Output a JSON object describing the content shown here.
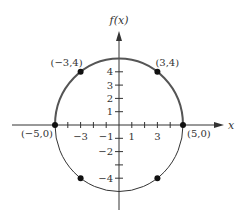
{
  "chart_data": {
    "type": "scatter",
    "title": "",
    "xlabel": "x",
    "ylabel": "f(x)",
    "xlim": [
      -5,
      5
    ],
    "ylim": [
      -5,
      5
    ],
    "grid": false,
    "curves": [
      {
        "name": "upper-semicircle",
        "equation": "y = sqrt(25 - x^2)",
        "emphasis": "bold"
      },
      {
        "name": "lower-semicircle",
        "equation": "y = -sqrt(25 - x^2)",
        "emphasis": "thin"
      }
    ],
    "points": [
      {
        "x": -3,
        "y": 4,
        "label": "(−3,4)"
      },
      {
        "x": 3,
        "y": 4,
        "label": "(3,4)"
      },
      {
        "x": -5,
        "y": 0,
        "label": "(−5,0)"
      },
      {
        "x": 5,
        "y": 0,
        "label": "(5,0)"
      },
      {
        "x": -3,
        "y": -4,
        "label": ""
      },
      {
        "x": 3,
        "y": -4,
        "label": ""
      }
    ],
    "x_ticks": [
      -4,
      -3,
      -2,
      -1,
      1,
      2,
      3,
      4
    ],
    "x_tick_labels": [
      {
        "value": -3,
        "text": "−3"
      },
      {
        "value": -1,
        "text": "−1"
      },
      {
        "value": 1,
        "text": "1"
      },
      {
        "value": 3,
        "text": "3"
      }
    ],
    "y_ticks": [
      -4,
      -3,
      -2,
      -1,
      1,
      2,
      3,
      4
    ],
    "y_tick_labels": [
      {
        "value": 4,
        "text": "4"
      },
      {
        "value": 3,
        "text": "3"
      },
      {
        "value": 2,
        "text": "2"
      },
      {
        "value": 1,
        "text": "1"
      },
      {
        "value": -2,
        "text": "−2"
      },
      {
        "value": -4,
        "text": "−4"
      }
    ]
  },
  "colors": {
    "ink": "#333333",
    "curve_bold": "#555555",
    "curve_thin": "#333333",
    "point": "#111111"
  }
}
